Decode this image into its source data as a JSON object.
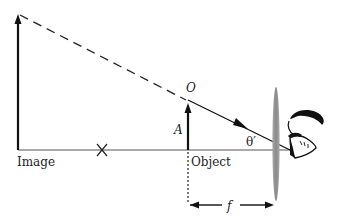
{
  "diagram": {
    "labels": {
      "image": "Image",
      "object": "Object",
      "object_height": "A",
      "object_tip": "O",
      "angle": "θ′",
      "focal_length": "f"
    },
    "colors": {
      "line": "#111111",
      "axis": "#555555",
      "lens": "#8c8c8c"
    }
  }
}
